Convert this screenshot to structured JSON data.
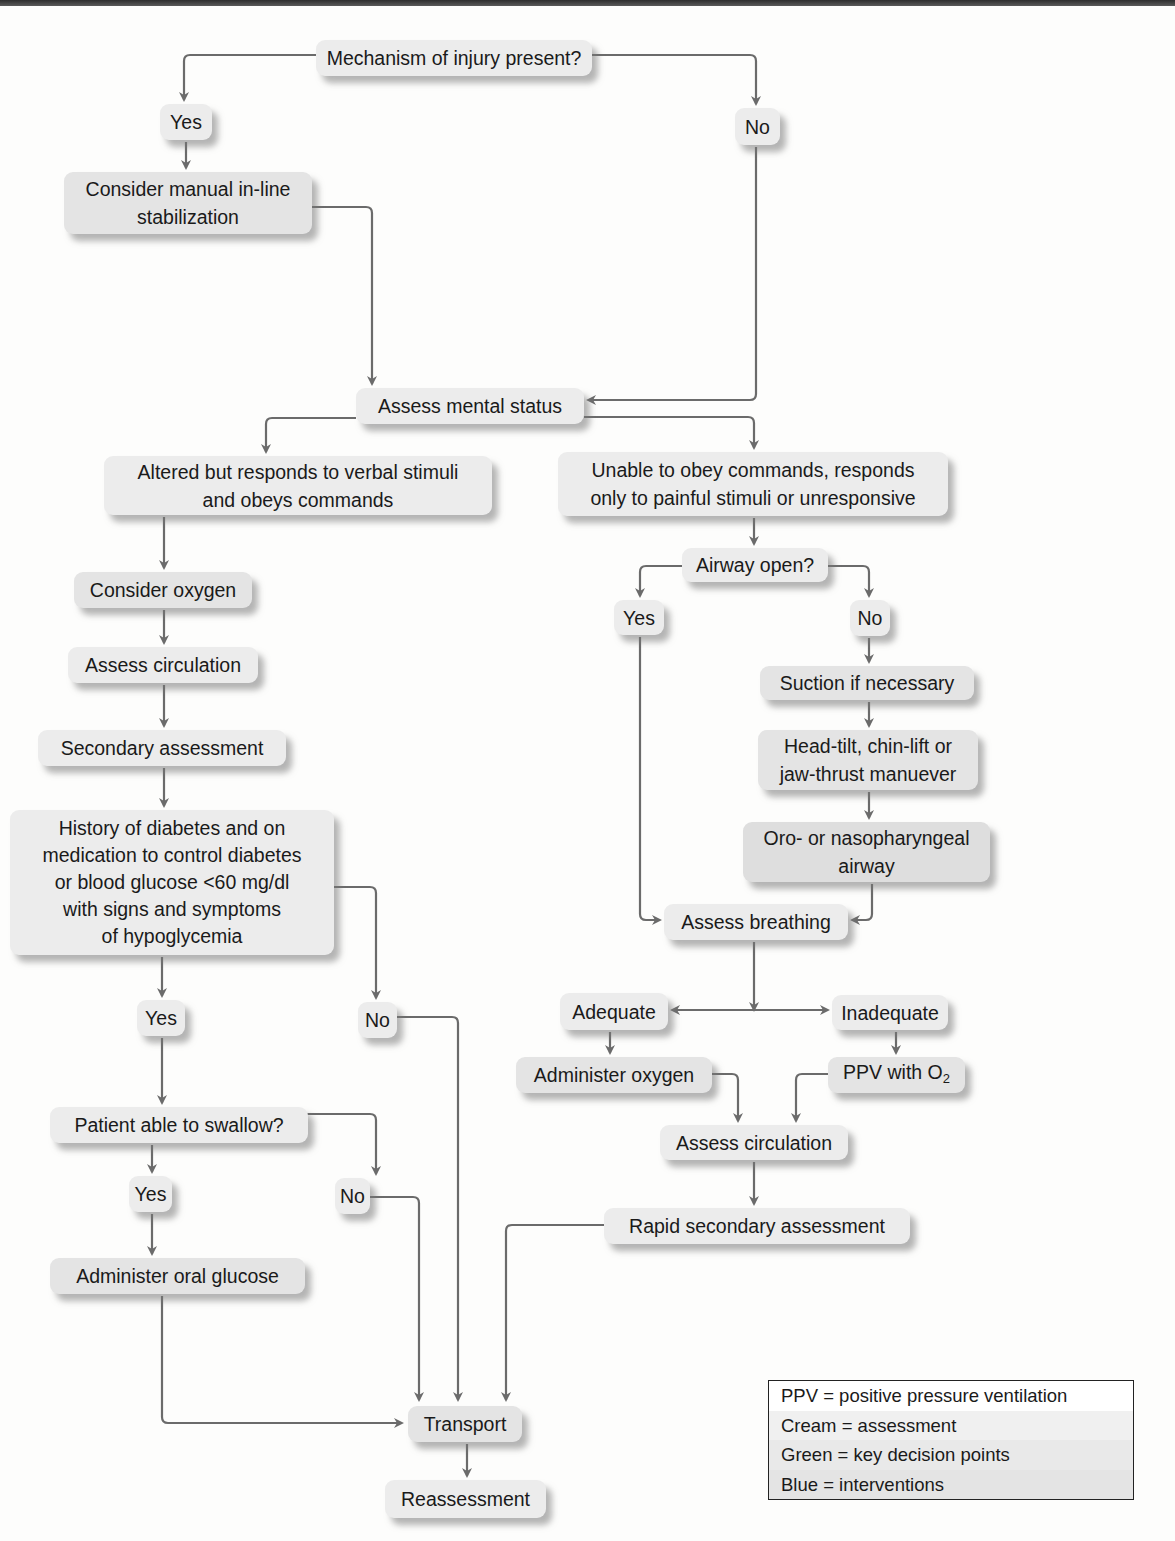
{
  "diagram": {
    "type": "flowchart",
    "colors": {
      "line": "#6b6b6b",
      "box": "#ececec",
      "shadow": "#8a8a8a"
    },
    "nodes": {
      "mechanism": "Mechanism of injury present?",
      "mech_yes": "Yes",
      "mech_no": "No",
      "manual_stab": "Consider manual in-line\nstabilization",
      "mental_status": "Assess mental status",
      "altered": "Altered but responds to verbal stimuli\nand obeys commands",
      "unable": "Unable to obey commands, responds\nonly to painful stimuli or unresponsive",
      "consider_oxygen": "Consider oxygen",
      "assess_circ_left": "Assess circulation",
      "secondary": "Secondary assessment",
      "diabetes": "History of diabetes and on\nmedication to control diabetes\nor blood glucose <60 mg/dl\nwith signs and symptoms\nof hypoglycemia",
      "diab_yes": "Yes",
      "diab_no": "No",
      "swallow": "Patient able to swallow?",
      "swallow_yes": "Yes",
      "swallow_no": "No",
      "oral_glucose": "Administer oral glucose",
      "airway_open": "Airway open?",
      "airway_yes": "Yes",
      "airway_no": "No",
      "suction": "Suction if necessary",
      "head_tilt": "Head-tilt, chin-lift or\njaw-thrust manuever",
      "oro": "Oro- or nasopharyngeal\nairway",
      "breathing": "Assess breathing",
      "adequate": "Adequate",
      "inadequate": "Inadequate",
      "admin_oxygen": "Administer oxygen",
      "ppv_prefix": "PPV with O",
      "ppv_sub": "2",
      "assess_circ_right": "Assess circulation",
      "rapid_secondary": "Rapid secondary assessment",
      "transport": "Transport",
      "reassessment": "Reassessment"
    },
    "legend": [
      "PPV = positive pressure ventilation",
      "Cream = assessment",
      "Green = key decision points",
      "Blue = interventions"
    ]
  }
}
